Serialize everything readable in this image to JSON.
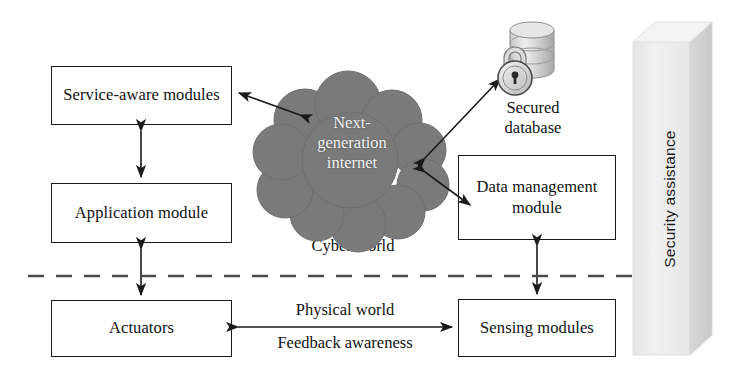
{
  "diagram": {
    "colors": {
      "cloud_fill": "#7a7a7a",
      "cloud_text": "#f2f2f2",
      "box_border": "#1a1a1a",
      "line": "#1a1a1a",
      "slab_face": "#ececec",
      "slab_side": "#d2d2d2",
      "background": "#ffffff"
    },
    "boxes": [
      {
        "id": "service_aware",
        "label": "Service-aware\nmodules"
      },
      {
        "id": "application",
        "label": "Application\nmodule"
      },
      {
        "id": "actuators",
        "label": "Actuators"
      },
      {
        "id": "data_management",
        "label": "Data\nmanagement\nmodule"
      },
      {
        "id": "sensing",
        "label": "Sensing\nmodules"
      }
    ],
    "cloud": {
      "label": "Next-\ngeneration\ninternet"
    },
    "labels": {
      "cyber_world": "Cyber world",
      "physical_world": "Physical world",
      "feedback_awareness": "Feedback awareness",
      "secured_database": "Secured\ndatabase",
      "security_assistance": "Security assistance"
    },
    "icons": {
      "database": "database-cylinder-icon",
      "lock": "padlock-icon",
      "divider": "dashed-divider"
    }
  }
}
